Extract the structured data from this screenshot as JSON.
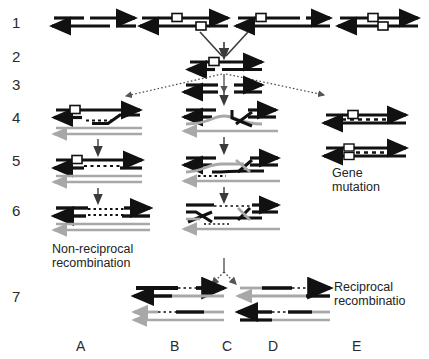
{
  "figure": {
    "background_color": "#ffffff",
    "strand_colors": {
      "black_duplex": "#111111",
      "gray_duplex": "#a8a8a8",
      "marker_square_fill": "#ffffff",
      "marker_square_stroke": "#111111",
      "dotted_heteroduplex": "#111111"
    }
  },
  "row_labels": [
    {
      "id": "row-1",
      "text": "1",
      "x": 12,
      "y": 22
    },
    {
      "id": "row-2",
      "text": "2",
      "x": 12,
      "y": 56
    },
    {
      "id": "row-3",
      "text": "3",
      "x": 12,
      "y": 83
    },
    {
      "id": "row-4",
      "text": "4",
      "x": 12,
      "y": 116
    },
    {
      "id": "row-5",
      "text": "5",
      "x": 12,
      "y": 158
    },
    {
      "id": "row-6",
      "text": "6",
      "x": 12,
      "y": 208
    },
    {
      "id": "row-7",
      "text": "7",
      "x": 12,
      "y": 294
    }
  ],
  "column_letters": [
    {
      "id": "col-a",
      "text": "A",
      "x": 76,
      "y": 346
    },
    {
      "id": "col-b",
      "text": "B",
      "x": 170,
      "y": 346
    },
    {
      "id": "col-c",
      "text": "C",
      "x": 222,
      "y": 346
    },
    {
      "id": "col-d",
      "text": "D",
      "x": 268,
      "y": 346
    },
    {
      "id": "col-e",
      "text": "E",
      "x": 352,
      "y": 346
    }
  ],
  "captions": [
    {
      "id": "gene-mutation",
      "lines": [
        "Gene",
        "mutation"
      ],
      "x": 332,
      "y": 172,
      "align": "left"
    },
    {
      "id": "non-reciprocal-recombination",
      "lines": [
        "Non-reciprocal",
        "recombination"
      ],
      "x": 52,
      "y": 248,
      "align": "left"
    },
    {
      "id": "reciprocal-recombination",
      "lines": [
        "Reciprocal",
        "recombinatio"
      ],
      "x": 334,
      "y": 284,
      "align": "left"
    }
  ],
  "panels": {
    "row1": {
      "description": "Four DNA duplex units with arrowheads; units 2,3,4 carry white square markers",
      "units": [
        {
          "id": "r1-u1",
          "marker": false
        },
        {
          "id": "r1-u2",
          "marker": true
        },
        {
          "id": "r1-u3",
          "marker": true
        },
        {
          "id": "r1-u4",
          "marker": true
        }
      ]
    },
    "row2": {
      "description": "Single black duplex with white square marker",
      "marker": true
    },
    "row3": {
      "description": "Two separated short duplex fragments"
    },
    "row4": {
      "left": "Black duplex with marker above gray duplex; invading strand crosses over",
      "middle": "Crossover (Holliday) intermediate between black and gray duplexes",
      "right": "Black duplex with marker and dashed segment"
    },
    "row5": {
      "left": "Heteroduplex with dotted mismatch region below marker",
      "middle": "Extended crossover intermediate with dotted region",
      "right": "Black duplex with open square and dashed segment"
    },
    "row6": {
      "left": "Resolved black duplex with dotted heteroduplex region over gray duplex",
      "middle": "Double crossover structure with dotted regions"
    },
    "row7": {
      "panel_b": "Two recombinant duplexes, non-reciprocal products",
      "panel_d": "Two recombinant duplexes, reciprocal products"
    }
  },
  "arrows": {
    "solid_vertical": [
      {
        "id": "arrow-row1-to-row2"
      },
      {
        "id": "arrow-row3-left-down"
      },
      {
        "id": "arrow-row4-left-down"
      },
      {
        "id": "arrow-row5-left-down"
      },
      {
        "id": "arrow-row4-mid-down"
      },
      {
        "id": "arrow-row5-mid-down"
      }
    ],
    "dotted_branching": [
      {
        "id": "branch-row2-to-left"
      },
      {
        "id": "branch-row2-to-right"
      },
      {
        "id": "branch-row7-splitter"
      }
    ]
  }
}
